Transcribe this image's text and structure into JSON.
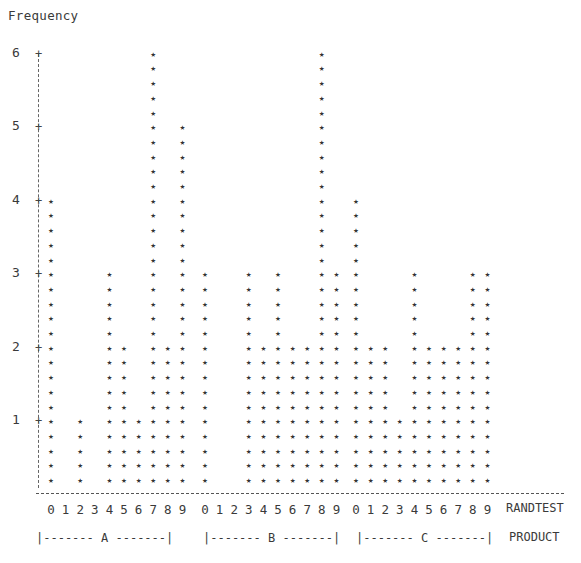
{
  "chart_data": {
    "type": "bar",
    "style": "ascii-vertical-bar",
    "title": "",
    "ylabel": "Frequency",
    "xlabel": "RANDTEST",
    "group_label": "PRODUCT",
    "ylim": [
      0,
      6
    ],
    "yticks": [
      "1",
      "2",
      "3",
      "4",
      "5",
      "6"
    ],
    "rows_per_unit": 5,
    "symbol": "*",
    "groups": [
      "A",
      "B",
      "C"
    ],
    "categories": [
      "0",
      "1",
      "2",
      "3",
      "4",
      "5",
      "6",
      "7",
      "8",
      "9"
    ],
    "series": [
      {
        "name": "A",
        "values": [
          4,
          0,
          1,
          0,
          3,
          2,
          1,
          6,
          2,
          5
        ]
      },
      {
        "name": "B",
        "values": [
          3,
          0,
          0,
          3,
          2,
          3,
          2,
          2,
          6,
          3
        ]
      },
      {
        "name": "C",
        "values": [
          4,
          2,
          2,
          1,
          3,
          2,
          2,
          2,
          3,
          3
        ]
      }
    ],
    "grid": false,
    "legend": null
  },
  "labels": {
    "frequency": "Frequency",
    "randtest": "RANDTEST",
    "product": "PRODUCT",
    "group_a": "|------- A -------|",
    "group_b": "|------- B -------|",
    "group_c": "|------- C -------|"
  }
}
